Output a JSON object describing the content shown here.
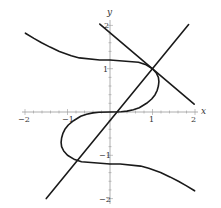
{
  "chart_data": {
    "type": "line",
    "title": "",
    "xlabel": "x",
    "ylabel": "y",
    "xlim": [
      -2,
      2
    ],
    "ylim": [
      -2,
      2
    ],
    "grid": false,
    "legend": null,
    "x_ticks": [
      -2,
      -1,
      1,
      2
    ],
    "y_ticks": [
      -2,
      -1,
      1,
      2
    ],
    "x_tick_labels": [
      "−2",
      "−1",
      "1",
      "2"
    ],
    "y_tick_labels": [
      "−2",
      "−1",
      "1",
      "2"
    ],
    "minor_tick_step": 0.2,
    "series": [
      {
        "name": "curve",
        "kind": "implicit curve (S-shaped, centrally symmetric), approx x^3 = 3.3y - 2.3y^3",
        "points": [
          [
            -1.99,
            1.82
          ],
          [
            -1.79,
            1.7
          ],
          [
            -1.61,
            1.6
          ],
          [
            -1.41,
            1.5
          ],
          [
            -1.19,
            1.4
          ],
          [
            -0.91,
            1.3
          ],
          [
            -0.72,
            1.25
          ],
          [
            -0.24,
            1.2
          ],
          [
            0.0,
            1.2
          ],
          [
            0.67,
            1.15
          ],
          [
            0.83,
            1.1
          ],
          [
            1.0,
            1.0
          ],
          [
            1.09,
            0.9
          ],
          [
            1.14,
            0.8
          ],
          [
            1.15,
            0.7
          ],
          [
            1.14,
            0.6
          ],
          [
            1.11,
            0.5
          ],
          [
            1.06,
            0.4
          ],
          [
            0.98,
            0.3
          ],
          [
            0.86,
            0.2
          ],
          [
            0.69,
            0.1
          ],
          [
            0.55,
            0.05
          ],
          [
            0.4,
            0.02
          ],
          [
            0.26,
            0.005
          ],
          [
            0.0,
            0.0
          ],
          [
            -0.26,
            -0.005
          ],
          [
            -0.4,
            -0.02
          ],
          [
            -0.55,
            -0.05
          ],
          [
            -0.69,
            -0.1
          ],
          [
            -0.86,
            -0.2
          ],
          [
            -0.98,
            -0.3
          ],
          [
            -1.06,
            -0.4
          ],
          [
            -1.11,
            -0.5
          ],
          [
            -1.14,
            -0.6
          ],
          [
            -1.15,
            -0.7
          ],
          [
            -1.14,
            -0.8
          ],
          [
            -1.09,
            -0.9
          ],
          [
            -1.0,
            -1.0
          ],
          [
            -0.83,
            -1.1
          ],
          [
            -0.67,
            -1.15
          ],
          [
            0.0,
            -1.2
          ],
          [
            0.24,
            -1.2
          ],
          [
            0.72,
            -1.25
          ],
          [
            0.91,
            -1.3
          ],
          [
            1.19,
            -1.4
          ],
          [
            1.41,
            -1.5
          ],
          [
            1.61,
            -1.6
          ],
          [
            1.79,
            -1.7
          ],
          [
            1.99,
            -1.82
          ]
        ]
      },
      {
        "name": "tangent line at (1,1)",
        "kind": "line",
        "slope": -0.8333,
        "through": [
          1,
          1
        ],
        "points": [
          [
            -0.24,
            2.03
          ],
          [
            1.98,
            0.18
          ]
        ]
      },
      {
        "name": "normal line at (1,1)",
        "kind": "line",
        "slope": 1.2,
        "through": [
          1,
          1
        ],
        "points": [
          [
            -1.5,
            -2.0
          ],
          [
            1.85,
            2.02
          ]
        ]
      }
    ],
    "annotations": []
  },
  "labels": {
    "x_axis": "x",
    "y_axis": "y",
    "x_ticks": [
      "−2",
      "−1",
      "1",
      "2"
    ],
    "y_ticks": [
      "2",
      "1",
      "−1",
      "−2"
    ]
  }
}
